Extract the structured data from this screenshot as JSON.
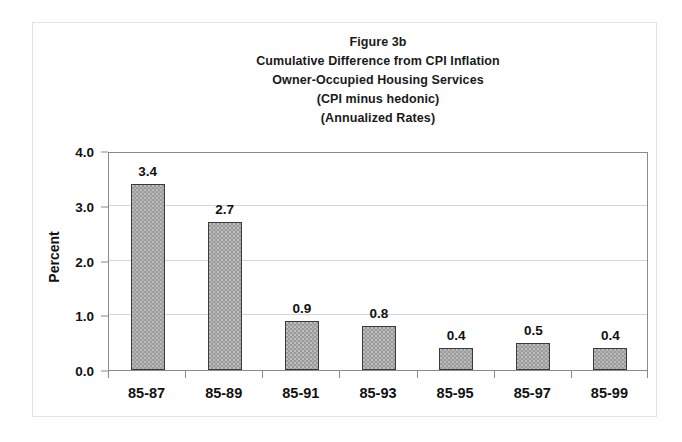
{
  "chart_data": {
    "type": "bar",
    "title": "Figure 3b\nCumulative Difference from CPI Inflation\nOwner-Occupied Housing Services\n(CPI minus hedonic)\n(Annualized Rates)",
    "title_lines": [
      "Figure 3b",
      "Cumulative Difference from CPI Inflation",
      "Owner-Occupied Housing Services",
      "(CPI minus hedonic)",
      "(Annualized Rates)"
    ],
    "categories": [
      "85-87",
      "85-89",
      "85-91",
      "85-93",
      "85-95",
      "85-97",
      "85-99"
    ],
    "values": [
      3.4,
      2.7,
      0.9,
      0.8,
      0.4,
      0.5,
      0.4
    ],
    "data_labels": [
      "3.4",
      "2.7",
      "0.9",
      "0.8",
      "0.4",
      "0.5",
      "0.4"
    ],
    "xlabel": "",
    "ylabel": "Percent",
    "ylim": [
      0.0,
      4.0
    ],
    "ytick_values": [
      0.0,
      1.0,
      2.0,
      3.0,
      4.0
    ],
    "ytick_labels": [
      "0.0",
      "1.0",
      "2.0",
      "3.0",
      "4.0"
    ],
    "grid": true,
    "legend": false,
    "legend_position": "none",
    "bar_fill_color": "#9a9a9a",
    "bar_border_color": "#3a3a3a",
    "gridline_color": "#d5d5d5",
    "axis_color": "#8a8a8a",
    "text_color": "#111111",
    "background_color": "#ffffff"
  }
}
